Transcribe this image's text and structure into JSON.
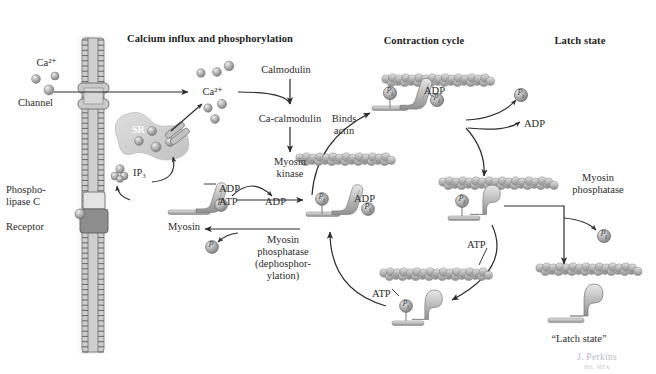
{
  "figure": {
    "background": "#ffffff",
    "ink": "#2b2b2b",
    "fill_light": "#d8d8d8",
    "fill_mid": "#b4b4b4",
    "fill_dark": "#8a8a8a",
    "membrane": "#7d7d7d"
  },
  "headers": [
    {
      "id": "calcium-influx",
      "label": "Calcium influx and phosphorylation",
      "x": 210,
      "y": 39
    },
    {
      "id": "contraction-cycle",
      "label": "Contraction cycle",
      "x": 424,
      "y": 41
    },
    {
      "id": "latch-state",
      "label": "Latch state",
      "x": 580,
      "y": 41
    }
  ],
  "left_panel": {
    "ca_extracellular": "Ca²⁺",
    "channel": "Channel",
    "sr": "SR",
    "ip3": "IP₃",
    "phospholipase_c": "Phospho-\nlipase C",
    "phospholipase_c_line1": "Phospho-",
    "phospholipase_c_line2": "lipase C",
    "receptor": "Receptor",
    "ca_cytosol": "Ca²⁺",
    "calmodulin": "Calmodulin",
    "ca_calmodulin": "Ca-calmodulin",
    "myosin_kinase_line1": "Myosin",
    "myosin_kinase_line2": "kinase",
    "myosin": "Myosin",
    "adp_label": "ADP",
    "atp_in": "ATP",
    "adp_out": "ADP",
    "phosphatase_line1": "Myosin",
    "phosphatase_line2": "phosphatase",
    "phosphatase_line3": "(dephosphor-",
    "phosphatase_line4": "ylation)",
    "phosphate_badge": "P"
  },
  "cycle_panel": {
    "binds_actin_line1": "Binds",
    "binds_actin_line2": "actin",
    "adp_top": "ADP",
    "adp_release": "ADP",
    "adp_left": "ADP",
    "atp_right": "ATP",
    "atp_bottom": "ATP",
    "phosphate_badge": "P",
    "phosphate_sub": "i"
  },
  "latch_panel": {
    "myosin_phosphatase_line1": "Myosin",
    "myosin_phosphatase_line2": "phosphatase",
    "latch_state_caption": "“Latch state”",
    "phosphate_badge": "P"
  },
  "credit": {
    "name": "J. Perkins",
    "degrees": "MS, MFA"
  }
}
